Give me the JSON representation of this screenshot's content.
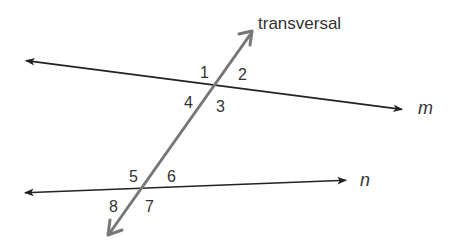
{
  "diagram": {
    "title_label": "transversal",
    "colors": {
      "parallel_lines": "#222222",
      "transversal": "#777777",
      "text": "#333333"
    },
    "lines": [
      {
        "name": "m",
        "label": "m",
        "from": [
          21,
          60
        ],
        "to": [
          407,
          110
        ]
      },
      {
        "name": "n",
        "label": "n",
        "from": [
          20,
          193
        ],
        "to": [
          351,
          180
        ]
      },
      {
        "name": "transversal",
        "label": "transversal",
        "from": [
          108,
          236
        ],
        "to": [
          253,
          30
        ]
      }
    ],
    "angles": [
      {
        "id": "1",
        "label": "1"
      },
      {
        "id": "2",
        "label": "2"
      },
      {
        "id": "3",
        "label": "3"
      },
      {
        "id": "4",
        "label": "4"
      },
      {
        "id": "5",
        "label": "5"
      },
      {
        "id": "6",
        "label": "6"
      },
      {
        "id": "7",
        "label": "7"
      },
      {
        "id": "8",
        "label": "8"
      }
    ]
  }
}
